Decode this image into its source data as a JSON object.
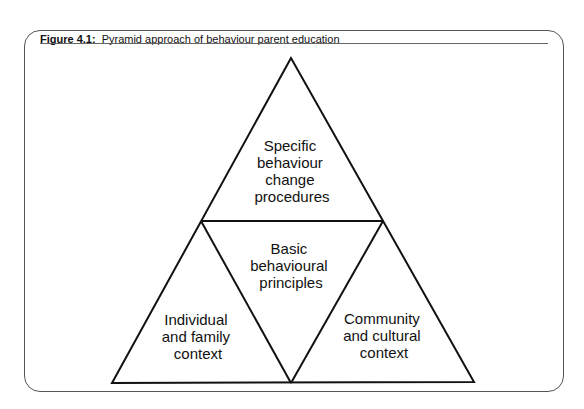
{
  "figure": {
    "label": "Figure 4.1:",
    "title": "Pyramid approach of behaviour parent education"
  },
  "diagram": {
    "type": "pyramid",
    "sections": [
      {
        "id": "top",
        "lines": [
          "Specific",
          "behaviour",
          "change",
          "procedures"
        ]
      },
      {
        "id": "middle",
        "lines": [
          "Basic",
          "behavioural",
          "principles"
        ]
      },
      {
        "id": "bottom-left",
        "lines": [
          "Individual",
          "and family",
          "context"
        ]
      },
      {
        "id": "bottom-right",
        "lines": [
          "Community",
          "and cultural",
          "context"
        ]
      }
    ]
  }
}
